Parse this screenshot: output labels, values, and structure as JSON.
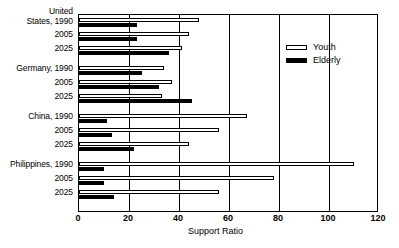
{
  "chart_data": {
    "type": "bar",
    "orientation": "horizontal",
    "title": "",
    "xlabel": "Support Ratio",
    "ylabel": "",
    "xlim": [
      0,
      120
    ],
    "xticks": [
      0,
      20,
      40,
      60,
      80,
      100,
      120
    ],
    "grid": true,
    "legend_position": "upper-right",
    "categories": [
      "United States, 1990",
      "2005",
      "2025",
      "Germany, 1990",
      "2005",
      "2025",
      "China, 1990",
      "2005",
      "2025",
      "Philippines, 1990",
      "2005",
      "2025"
    ],
    "series": [
      {
        "name": "Youth",
        "color": "#ffffff",
        "values": [
          48,
          44,
          41,
          34,
          37,
          33,
          67,
          56,
          44,
          110,
          78,
          56
        ]
      },
      {
        "name": "Elderly",
        "color": "#000000",
        "values": [
          23,
          23,
          36,
          25,
          32,
          45,
          11,
          13,
          22,
          10,
          10,
          14
        ]
      }
    ],
    "groups": [
      {
        "country": "United States",
        "years": [
          "1990",
          "2005",
          "2025"
        ]
      },
      {
        "country": "Germany",
        "years": [
          "1990",
          "2005",
          "2025"
        ]
      },
      {
        "country": "China",
        "years": [
          "1990",
          "2005",
          "2025"
        ]
      },
      {
        "country": "Philippines",
        "years": [
          "1990",
          "2005",
          "2025"
        ]
      }
    ]
  },
  "axis": {
    "x_title": "Support Ratio",
    "tick_labels": [
      "0",
      "20",
      "40",
      "60",
      "80",
      "100",
      "120"
    ]
  },
  "y_axis": {
    "labels": [
      "United\nStates, 1990",
      "2005",
      "2025",
      "Germany, 1990",
      "2005",
      "2025",
      "China, 1990",
      "2005",
      "2025",
      "Philippines, 1990",
      "2005",
      "2025"
    ]
  },
  "legend": {
    "items": [
      {
        "label": "Youth",
        "swatch": "hollow"
      },
      {
        "label": "Elderly",
        "swatch": "filled"
      }
    ]
  }
}
